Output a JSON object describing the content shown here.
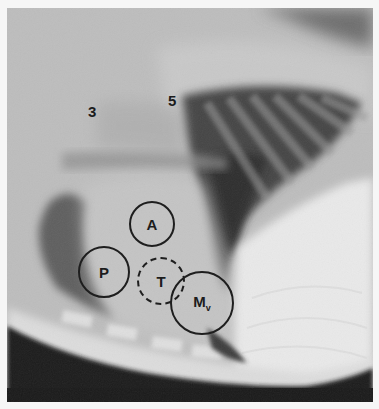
{
  "image": {
    "description": "Lateral thoracic radiograph with heart valve auscultation areas marked",
    "rib_labels": [
      "3",
      "5"
    ],
    "valve_areas": [
      {
        "id": "pulmonic",
        "label": "P",
        "style": "solid"
      },
      {
        "id": "aortic",
        "label": "A",
        "style": "solid"
      },
      {
        "id": "tricuspid",
        "label": "T",
        "style": "dashed"
      },
      {
        "id": "mitral",
        "label": "M",
        "subscript": "v",
        "style": "solid"
      }
    ]
  }
}
